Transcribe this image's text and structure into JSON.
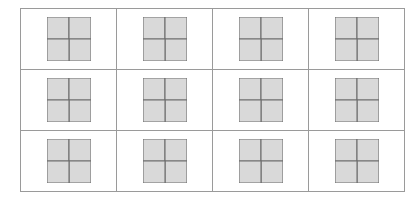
{
  "figure": {
    "title": "",
    "kind": "pinwheel-grid",
    "background_color": "#ffffff",
    "border_color": "#9a9a9a",
    "blade_fill_color": "#d9d9d9",
    "blade_stroke_color": "#6e6e6e",
    "grid": {
      "rows": 3,
      "columns": 4,
      "cell_count": 12
    },
    "cells": [
      {
        "id": "cell-r1c1",
        "row": 1,
        "column": 1,
        "name": "pinwheel-r1c1",
        "blades": 4,
        "notch_offset": 0.3,
        "rotation_deg": 0
      },
      {
        "id": "cell-r1c2",
        "row": 1,
        "column": 2,
        "name": "pinwheel-r1c2",
        "blades": 4,
        "notch_offset": 0.42,
        "rotation_deg": 0
      },
      {
        "id": "cell-r1c3",
        "row": 1,
        "column": 3,
        "name": "pinwheel-r1c3",
        "blades": 4,
        "notch_offset": 0.36,
        "rotation_deg": 0
      },
      {
        "id": "cell-r1c4",
        "row": 1,
        "column": 4,
        "name": "pinwheel-r1c4",
        "blades": 4,
        "notch_offset": 0.48,
        "rotation_deg": 0
      },
      {
        "id": "cell-r2c1",
        "row": 2,
        "column": 1,
        "name": "pinwheel-r2c1",
        "blades": 4,
        "notch_offset": 0.34,
        "rotation_deg": 0
      },
      {
        "id": "cell-r2c2",
        "row": 2,
        "column": 2,
        "name": "pinwheel-r2c2",
        "blades": 4,
        "notch_offset": 0.4,
        "rotation_deg": 0
      },
      {
        "id": "cell-r2c3",
        "row": 2,
        "column": 3,
        "name": "pinwheel-r2c3",
        "blades": 4,
        "notch_offset": 0.44,
        "rotation_deg": 0
      },
      {
        "id": "cell-r2c4",
        "row": 2,
        "column": 4,
        "name": "pinwheel-r2c4",
        "blades": 4,
        "notch_offset": 0.33,
        "rotation_deg": 0
      },
      {
        "id": "cell-r3c1",
        "row": 3,
        "column": 1,
        "name": "pinwheel-r3c1",
        "blades": 4,
        "notch_offset": 0.38,
        "rotation_deg": 0
      },
      {
        "id": "cell-r3c2",
        "row": 3,
        "column": 2,
        "name": "pinwheel-r3c2",
        "blades": 4,
        "notch_offset": 0.46,
        "rotation_deg": 0
      },
      {
        "id": "cell-r3c3",
        "row": 3,
        "column": 3,
        "name": "pinwheel-r3c3",
        "blades": 4,
        "notch_offset": 0.31,
        "rotation_deg": 0
      },
      {
        "id": "cell-r3c4",
        "row": 3,
        "column": 4,
        "name": "pinwheel-r3c4",
        "blades": 4,
        "notch_offset": 0.5,
        "rotation_deg": 0
      }
    ]
  }
}
